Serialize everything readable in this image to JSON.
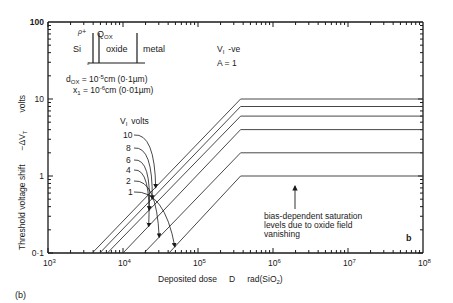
{
  "figure_label": "(b)",
  "panel_letter": "b",
  "chart_data": {
    "type": "line",
    "title": "",
    "xlabel": "Deposited dose   D   rad(SiO2)",
    "ylabel": "Threshold voltage shift   -ΔV_T   volts",
    "xscale": "log",
    "yscale": "log",
    "xlim": [
      1000,
      100000000
    ],
    "ylim": [
      0.1,
      100
    ],
    "x_tick_labels": [
      "10^3",
      "10^4",
      "10^5",
      "10^6",
      "10^7",
      "10^8"
    ],
    "y_tick_labels": [
      "0.1",
      "1",
      "10",
      "100"
    ],
    "grid": false,
    "legend_title": "V_I volts",
    "series": [
      {
        "name": "10",
        "x": [
          3900,
          370000,
          100000000
        ],
        "values": [
          0.1,
          10,
          10
        ]
      },
      {
        "name": "8",
        "x": [
          4900,
          370000,
          100000000
        ],
        "values": [
          0.1,
          8,
          8
        ]
      },
      {
        "name": "6",
        "x": [
          6200,
          370000,
          100000000
        ],
        "values": [
          0.1,
          6,
          6
        ]
      },
      {
        "name": "4",
        "x": [
          10000,
          370000,
          100000000
        ],
        "values": [
          0.1,
          4,
          4
        ]
      },
      {
        "name": "2",
        "x": [
          19000,
          370000,
          100000000
        ],
        "values": [
          0.1,
          2,
          2
        ]
      },
      {
        "name": "1",
        "x": [
          41000,
          370000,
          100000000
        ],
        "values": [
          0.1,
          1,
          1
        ]
      }
    ],
    "annotations": [
      "V_I  -ve",
      "A = 1",
      "d_OX = 10^-5 cm (0·1 µm)",
      "x_1 = 10^-6 cm (0·01 µm)",
      "bias-dependent saturation levels due to oxide field vanishing"
    ]
  },
  "inset": {
    "rho_label": "ρ+",
    "qox_label": "Q",
    "qox_sub": "OX",
    "si_label": "Si",
    "oxide_label": "oxide",
    "metal_label": "metal",
    "zero_label": "0"
  },
  "params": {
    "vi_label": "V",
    "vi_sub": "I",
    "vi_sign": "-ve",
    "a_label": "A = 1",
    "dox_label": "d",
    "dox_sub": "OX",
    "dox_value": " = 10",
    "dox_exp": "-5",
    "dox_unit": "cm  (0·1µm)",
    "x1_label": "x",
    "x1_sub": "1",
    "x1_value": " = 10",
    "x1_exp": "-6",
    "x1_unit": "cm  (0·01µm)"
  },
  "legend": {
    "title_v": "V",
    "title_sub": "I",
    "title_unit": "volts",
    "labels": [
      "10",
      "8",
      "6",
      "4",
      "2",
      "1"
    ]
  },
  "axes": {
    "y_ticks": [
      "100",
      "10",
      "1",
      "0·1"
    ],
    "x_tick_base": "10",
    "x_tick_exps": [
      "3",
      "4",
      "5",
      "6",
      "7",
      "8"
    ],
    "xlabel_main": "Deposited dose",
    "xlabel_sym": "D",
    "xlabel_unit": "rad(SiO",
    "xlabel_unit_sub": "2",
    "xlabel_unit_end": ")",
    "ylabel_main": "Threshold voltage shift",
    "ylabel_sym": "−ΔV",
    "ylabel_sym_sub": "T",
    "ylabel_unit": "volts"
  },
  "saturation_note": {
    "line1": "bias-dependent saturation",
    "line2": "levels due to oxide field",
    "line3": "vanishing"
  }
}
